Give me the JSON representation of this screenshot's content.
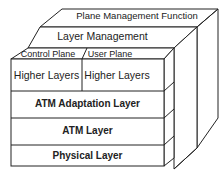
{
  "diagram": {
    "planes": {
      "plane_management": "Plane Management Function",
      "layer_management": "Layer Management",
      "control_plane": "Control Plane",
      "user_plane": "User Plane"
    },
    "layers": {
      "higher_control": "Higher Layers",
      "higher_user": "Higher Layers",
      "aal": "ATM Adaptation Layer",
      "atm": "ATM Layer",
      "physical": "Physical Layer"
    },
    "colors": {
      "line": "#222222",
      "background": "#ffffff"
    }
  }
}
